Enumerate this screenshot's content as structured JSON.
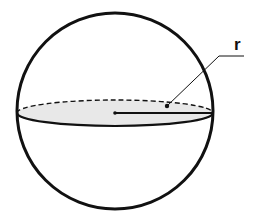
{
  "diagram": {
    "type": "sphere",
    "label": "r",
    "label_meaning": "radius",
    "colors": {
      "stroke": "#111111",
      "equator_fill": "#e8e8e8",
      "background": "#ffffff"
    }
  }
}
